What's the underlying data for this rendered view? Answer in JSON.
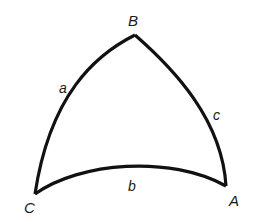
{
  "diagram": {
    "type": "spherical-triangle",
    "stroke_color": "#111111",
    "background": "#ffffff",
    "vertices": {
      "A": {
        "label": "A",
        "x": 226,
        "y": 186
      },
      "B": {
        "label": "B",
        "x": 135,
        "y": 35
      },
      "C": {
        "label": "C",
        "x": 35,
        "y": 194
      }
    },
    "sides": {
      "a": {
        "label": "a",
        "from": "B",
        "to": "C"
      },
      "b": {
        "label": "b",
        "from": "C",
        "to": "A"
      },
      "c": {
        "label": "c",
        "from": "A",
        "to": "B"
      }
    }
  }
}
